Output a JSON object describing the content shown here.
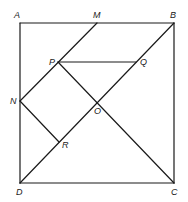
{
  "diagram": {
    "stroke_color": "#1a1a1a",
    "background": "#ffffff",
    "points": {
      "A": {
        "label": "A",
        "x": 20,
        "y": 23,
        "lx": 14,
        "ly": 18
      },
      "M": {
        "label": "M",
        "x": 97,
        "y": 23,
        "lx": 93,
        "ly": 18
      },
      "B": {
        "label": "B",
        "x": 174,
        "y": 23,
        "lx": 170,
        "ly": 18
      },
      "N": {
        "label": "N",
        "x": 20,
        "y": 101,
        "lx": 10,
        "ly": 104
      },
      "P": {
        "label": "P",
        "x": 58,
        "y": 62,
        "lx": 49,
        "ly": 65
      },
      "Q": {
        "label": "Q",
        "x": 136,
        "y": 62,
        "lx": 140,
        "ly": 65
      },
      "O": {
        "label": "O",
        "x": 97,
        "y": 101,
        "lx": 94,
        "ly": 114
      },
      "R": {
        "label": "R",
        "x": 59,
        "y": 142,
        "lx": 62,
        "ly": 148
      },
      "D": {
        "label": "D",
        "x": 20,
        "y": 183,
        "lx": 16,
        "ly": 195
      },
      "C": {
        "label": "C",
        "x": 174,
        "y": 183,
        "lx": 171,
        "ly": 195
      }
    },
    "segments": [
      {
        "name": "AB",
        "from": "A",
        "to": "B"
      },
      {
        "name": "BC",
        "from": "B",
        "to": "C"
      },
      {
        "name": "CD",
        "from": "C",
        "to": "D"
      },
      {
        "name": "DA",
        "from": "D",
        "to": "A"
      },
      {
        "name": "BD",
        "from": "B",
        "to": "D"
      },
      {
        "name": "MN",
        "from": "M",
        "to": "N"
      },
      {
        "name": "PQ",
        "from": "P",
        "to": "Q"
      },
      {
        "name": "PC",
        "from": "P",
        "to": "C"
      },
      {
        "name": "NR",
        "from": "N",
        "to": "R"
      }
    ]
  }
}
